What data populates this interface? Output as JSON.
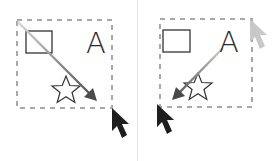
{
  "diagram": {
    "panels": [
      {
        "id": "left",
        "direction": "top-left to bottom-right",
        "label": "A",
        "shapes": [
          "rectangle",
          "letter-A",
          "star"
        ],
        "selection_box": {
          "x": 17,
          "y": 20,
          "w": 95,
          "h": 88
        },
        "arrow": {
          "from": [
            18,
            22
          ],
          "to": [
            96,
            100
          ]
        },
        "cursor_end": [
          112,
          108
        ]
      },
      {
        "id": "right",
        "direction": "top-right to bottom-left",
        "label": "A",
        "shapes": [
          "rectangle",
          "letter-A",
          "star"
        ],
        "selection_box": {
          "x": 22,
          "y": 19,
          "w": 92,
          "h": 88
        },
        "arrow": {
          "from": [
            85,
            48
          ],
          "to": [
            35,
            99
          ]
        },
        "cursor_start": [
          112,
          19
        ],
        "cursor_end": [
          19,
          104
        ]
      }
    ],
    "colors": {
      "dashed_border": "#a8a8a8",
      "shape_stroke": "#333333",
      "arrow_dark": "#555555",
      "arrow_light": "#cfcfcf",
      "cursor_dark": "#1e1e1e",
      "cursor_faint": "#c8c8c8",
      "divider": "#e4e4e4"
    }
  }
}
